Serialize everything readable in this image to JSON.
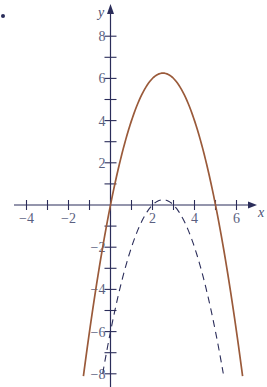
{
  "chart_data": {
    "type": "line",
    "title": "",
    "xlabel": "x",
    "ylabel": "y",
    "xlim": [
      -4.5,
      7.2
    ],
    "ylim": [
      -8.4,
      8.9
    ],
    "grid": false,
    "legend": null,
    "x_ticks": [
      -4,
      -3,
      -2,
      -1,
      1,
      2,
      3,
      4,
      5,
      6
    ],
    "x_tick_labels": [
      {
        "value": -4,
        "label": "−4"
      },
      {
        "value": -2,
        "label": "−2"
      },
      {
        "value": 2,
        "label": "2"
      },
      {
        "value": 4,
        "label": "4"
      },
      {
        "value": 6,
        "label": "6"
      }
    ],
    "y_ticks": [
      -8,
      -7,
      -6,
      -5,
      -4,
      -3,
      -2,
      -1,
      1,
      2,
      3,
      4,
      5,
      6,
      7,
      8
    ],
    "y_tick_labels": [
      {
        "value": 8,
        "label": "8"
      },
      {
        "value": 6,
        "label": "6"
      },
      {
        "value": 4,
        "label": "4"
      },
      {
        "value": 2,
        "label": "2"
      },
      {
        "value": -2,
        "label": "−2"
      },
      {
        "value": -4,
        "label": "−4"
      },
      {
        "value": -6,
        "label": "−6"
      },
      {
        "value": -8,
        "label": "−8"
      }
    ],
    "series": [
      {
        "name": "solid parabola",
        "equation": "y = 5x - x^2",
        "style": "solid",
        "color": "#9a5a3a",
        "coefficients": {
          "a": -1,
          "b": 5,
          "c": 0
        },
        "x_range": [
          -1.29,
          6.29
        ],
        "vertex": [
          2.5,
          6.25
        ],
        "x_intercepts": [
          0,
          5
        ]
      },
      {
        "name": "dashed parabola",
        "equation": "y = -x^2 + 5x - 6",
        "style": "dashed",
        "color": "#2b2d5a",
        "coefficients": {
          "a": -1,
          "b": 5,
          "c": -6
        },
        "x_range": [
          -0.37,
          5.37
        ],
        "vertex": [
          2.5,
          0.25
        ],
        "x_intercepts": [
          2,
          3
        ]
      }
    ]
  },
  "colors": {
    "axis": "#2b2d5a",
    "tick_label": "#5a5f80",
    "bullet": "#2b2d5a"
  }
}
